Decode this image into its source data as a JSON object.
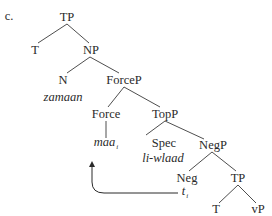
{
  "example_label": "c.",
  "tree": {
    "nodes": {
      "tp_root": "TP",
      "t1": "T",
      "np": "NP",
      "n": "N",
      "n_word": "zamaan",
      "forcep": "ForceP",
      "force": "Force",
      "force_word": "maa",
      "force_index": "i",
      "topp": "TopP",
      "spec": "Spec",
      "spec_word": "li-wlaad",
      "negp": "NegP",
      "neg": "Neg",
      "trace": "t",
      "trace_index": "i",
      "tp2": "TP",
      "t2": "T",
      "vp": "vP"
    },
    "edges": [
      [
        "TP",
        "T"
      ],
      [
        "TP",
        "NP"
      ],
      [
        "NP",
        "N"
      ],
      [
        "NP",
        "ForceP"
      ],
      [
        "ForceP",
        "Force"
      ],
      [
        "ForceP",
        "TopP"
      ],
      [
        "Force",
        "maa"
      ],
      [
        "TopP",
        "Spec"
      ],
      [
        "TopP",
        "NegP"
      ],
      [
        "NegP",
        "Neg"
      ],
      [
        "NegP",
        "TP"
      ],
      [
        "TP",
        "T"
      ],
      [
        "TP",
        "vP"
      ]
    ],
    "movement_arrow": {
      "from": "t_i",
      "to": "maa_i"
    }
  },
  "colors": {
    "ink": "#2a2a2a",
    "background": "#ffffff"
  }
}
